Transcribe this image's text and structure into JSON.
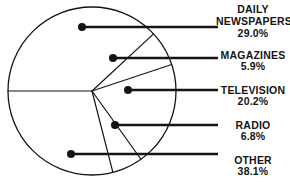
{
  "chart_data": {
    "type": "pie",
    "title": "",
    "subtitle": "",
    "xlabel": "",
    "ylabel": "",
    "legend_position": "right-callout",
    "grid": false,
    "units": "percent",
    "total": 100.0,
    "start_angle_deg": 180,
    "direction": "clockwise",
    "categories": [
      "DAILY NEWSPAPERS",
      "MAGAZINES",
      "TELEVISION",
      "RADIO",
      "OTHER"
    ],
    "values": [
      29.0,
      5.9,
      20.2,
      6.8,
      38.1
    ],
    "slices": [
      {
        "label_line1": "DAILY",
        "label_line2": "NEWSPAPERS",
        "label": "DAILY NEWSPAPERS",
        "value": 29.0,
        "value_text": "29.0%"
      },
      {
        "label_line1": "MAGAZINES",
        "label_line2": "",
        "label": "MAGAZINES",
        "value": 5.9,
        "value_text": "5.9%"
      },
      {
        "label_line1": "TELEVISION",
        "label_line2": "",
        "label": "TELEVISION",
        "value": 20.2,
        "value_text": "20.2%"
      },
      {
        "label_line1": "RADIO",
        "label_line2": "",
        "label": "RADIO",
        "value": 6.8,
        "value_text": "6.8%"
      },
      {
        "label_line1": "OTHER",
        "label_line2": "",
        "label": "OTHER",
        "value": 38.1,
        "value_text": "38.1%"
      }
    ]
  },
  "style": {
    "stroke_color": "#141414",
    "fill_color": "#ffffff",
    "text_color": "#141414",
    "background": "#ffffff"
  },
  "geometry": {
    "center_x": 92,
    "center_y": 91,
    "radius": 84,
    "leader_end_x": 218,
    "dot_radius": 4,
    "dots": [
      {
        "x": 82,
        "y": 27,
        "leader_y": 27
      },
      {
        "x": 113,
        "y": 58,
        "leader_y": 58
      },
      {
        "x": 128,
        "y": 90,
        "leader_y": 90
      },
      {
        "x": 115,
        "y": 125,
        "leader_y": 125
      },
      {
        "x": 71,
        "y": 154,
        "leader_y": 154
      }
    ]
  }
}
